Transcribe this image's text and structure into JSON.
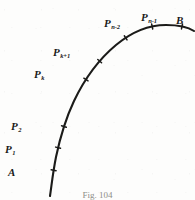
{
  "figure": {
    "caption": "Fig. 104",
    "curve_color": "#1b1b19",
    "label_color": "#1a1a18",
    "background_color": "#fdfdfc",
    "endpoints": [
      {
        "name": "A",
        "base": "A",
        "sub": "",
        "label_x": 8,
        "label_y": 163,
        "tick_x": 55,
        "tick_y": 170
      },
      {
        "name": "B",
        "base": "B",
        "sub": "",
        "label_x": 176,
        "label_y": 11,
        "tick_x": 181,
        "tick_y": 29
      }
    ],
    "points": [
      {
        "name": "P1",
        "base": "P",
        "sub": "1",
        "label_x": 5,
        "label_y": 140,
        "tick_x": 57,
        "tick_y": 147
      },
      {
        "name": "P2",
        "base": "P",
        "sub": "2",
        "label_x": 11,
        "label_y": 117,
        "tick_x": 62,
        "tick_y": 126
      },
      {
        "name": "Pk",
        "base": "P",
        "sub": "k",
        "label_x": 34,
        "label_y": 65,
        "tick_x": 81,
        "tick_y": 76
      },
      {
        "name": "Pk+1",
        "base": "P",
        "sub": "k+1",
        "label_x": 53,
        "label_y": 43,
        "tick_x": 95,
        "tick_y": 57
      },
      {
        "name": "Pn-2",
        "base": "P",
        "sub": "n-2",
        "label_x": 104,
        "label_y": 14,
        "tick_x": 122,
        "tick_y": 32
      },
      {
        "name": "Pn-1",
        "base": "P",
        "sub": "n-1",
        "label_x": 141,
        "label_y": 8,
        "tick_x": 152,
        "tick_y": 25
      }
    ],
    "curve_path": "M 50,196 C 52,182 53,172 56,157 C 60,138 65,120 74,101 C 84,80 98,60 116,45 C 134,30 152,25 166,25 C 178,25 188,27 194,31",
    "tick_length": 5
  }
}
